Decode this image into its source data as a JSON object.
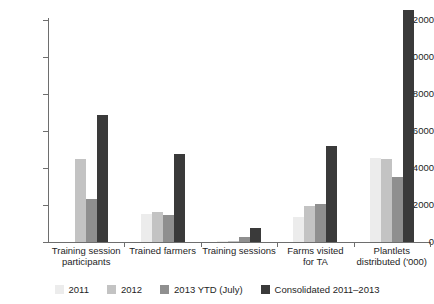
{
  "chart_data": {
    "type": "bar",
    "title": "",
    "subtitle": "",
    "xlabel": "",
    "ylabel": "",
    "ylim": [
      0,
      12000
    ],
    "yticks": [
      0,
      2000,
      4000,
      6000,
      8000,
      10000,
      12000
    ],
    "ytick_labels": [
      "0",
      "2000",
      "4000",
      "6000",
      "8000",
      "10000",
      "12000"
    ],
    "grid": false,
    "legend_position": "bottom",
    "categories": [
      "Training session participants",
      "Trained farmers",
      "Training sessions",
      "Farms visited for TA",
      "Plantlets distributed ('000)"
    ],
    "category_lines": [
      [
        "Training session",
        "participants"
      ],
      [
        "Trained farmers",
        ""
      ],
      [
        "Training sessions",
        ""
      ],
      [
        "Farms visited",
        "for TA"
      ],
      [
        "Plantlets",
        "distributed ('000)"
      ]
    ],
    "series": [
      {
        "name": "2011",
        "color": "#ececec",
        "values": [
          0,
          1540,
          30,
          1330,
          4530
        ]
      },
      {
        "name": "2012",
        "color": "#c3c3c3",
        "values": [
          4460,
          1630,
          60,
          1950,
          4510
        ]
      },
      {
        "name": "2013 YTD (July)",
        "color": "#8f8f8f",
        "values": [
          2350,
          1480,
          290,
          2070,
          3520
        ]
      },
      {
        "name": "Consolidated 2011–2013",
        "color": "#3a3a3a",
        "values": [
          6860,
          4730,
          770,
          5210,
          12520
        ]
      }
    ],
    "notes": {
      "clipped_bar": "Plantlets distributed ('000) Consolidated bar extends above the 12000 axis top"
    }
  }
}
